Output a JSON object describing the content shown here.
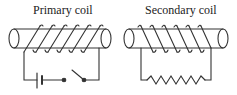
{
  "diagram": {
    "type": "transformer-induction-coils",
    "primary": {
      "label": "Primary coil",
      "turns": 6,
      "circuit_components": [
        "battery",
        "switch"
      ],
      "switch_state": "open"
    },
    "secondary": {
      "label": "Secondary coil",
      "turns": 6,
      "circuit_components": [
        "resistor"
      ]
    },
    "colors": {
      "stroke": "#333333",
      "background": "#ffffff"
    }
  }
}
